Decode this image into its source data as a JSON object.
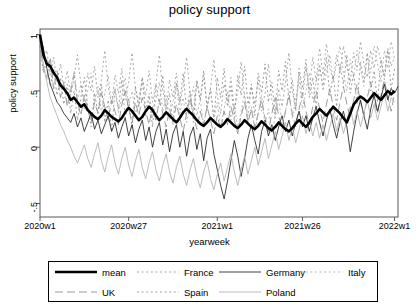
{
  "chart": {
    "title": "policy support",
    "xlabel": "yearweek",
    "ylabel": "policy support"
  },
  "axes": {
    "y_ticks": [
      "1",
      ".5",
      "0",
      "-.5"
    ],
    "x_ticks": [
      "2020w1",
      "2020w27",
      "2021w1",
      "2021w26",
      "2022w1"
    ]
  },
  "legend": {
    "row1": [
      {
        "label": "mean",
        "style": "solid-thick",
        "color": "#000000"
      },
      {
        "label": "France",
        "style": "dotted",
        "color": "#999999"
      },
      {
        "label": "Germany",
        "style": "solid",
        "color": "#222222"
      },
      {
        "label": "Italy",
        "style": "dotted",
        "color": "#aaaaaa"
      }
    ],
    "row2": [
      {
        "label": "UK",
        "style": "dashed-long",
        "color": "#8a8a8a"
      },
      {
        "label": "Spain",
        "style": "dotted",
        "color": "#8a8a8a"
      },
      {
        "label": "Poland",
        "style": "solid",
        "color": "#b0b0b0"
      }
    ]
  },
  "chart_data": {
    "type": "line",
    "title": "policy support",
    "xlabel": "yearweek",
    "ylabel": "policy support",
    "xlim": [
      0,
      105
    ],
    "ylim": [
      -0.62,
      1.05
    ],
    "grid": false,
    "legend_position": "bottom-outside",
    "x_tick_values": [
      0,
      26,
      52,
      77,
      104
    ],
    "x_tick_labels": [
      "2020w1",
      "2020w27",
      "2021w1",
      "2021w26",
      "2022w1"
    ],
    "y_tick_values": [
      1,
      0.5,
      0,
      -0.5
    ],
    "y_tick_labels": [
      "1",
      ".5",
      "0",
      "-.5"
    ],
    "series": [
      {
        "name": "mean",
        "style": "solid-thick",
        "color": "#000000",
        "values": [
          1.0,
          0.82,
          0.74,
          0.72,
          0.66,
          0.62,
          0.55,
          0.52,
          0.48,
          0.42,
          0.44,
          0.4,
          0.36,
          0.38,
          0.33,
          0.3,
          0.27,
          0.25,
          0.28,
          0.33,
          0.3,
          0.27,
          0.25,
          0.23,
          0.26,
          0.31,
          0.35,
          0.32,
          0.28,
          0.24,
          0.27,
          0.32,
          0.36,
          0.33,
          0.28,
          0.24,
          0.27,
          0.31,
          0.28,
          0.25,
          0.22,
          0.26,
          0.31,
          0.34,
          0.31,
          0.28,
          0.24,
          0.21,
          0.19,
          0.22,
          0.26,
          0.23,
          0.2,
          0.18,
          0.21,
          0.25,
          0.22,
          0.19,
          0.17,
          0.2,
          0.24,
          0.21,
          0.18,
          0.16,
          0.19,
          0.23,
          0.2,
          0.17,
          0.15,
          0.18,
          0.22,
          0.19,
          0.16,
          0.14,
          0.17,
          0.21,
          0.24,
          0.21,
          0.18,
          0.22,
          0.27,
          0.3,
          0.34,
          0.31,
          0.28,
          0.32,
          0.36,
          0.33,
          0.3,
          0.26,
          0.22,
          0.3,
          0.38,
          0.42,
          0.45,
          0.43,
          0.4,
          0.44,
          0.48,
          0.45,
          0.42,
          0.46,
          0.5,
          0.47,
          0.5
        ]
      },
      {
        "name": "UK",
        "style": "dashed-long",
        "color": "#8a8a8a",
        "values": [
          0.95,
          0.7,
          0.62,
          0.8,
          0.52,
          0.68,
          0.44,
          0.58,
          0.36,
          0.5,
          0.64,
          0.4,
          0.28,
          0.46,
          0.34,
          0.22,
          0.4,
          0.3,
          0.48,
          0.36,
          0.24,
          0.42,
          0.32,
          0.2,
          0.38,
          0.5,
          0.34,
          0.22,
          0.4,
          0.28,
          0.44,
          0.32,
          0.2,
          0.36,
          0.24,
          0.42,
          0.3,
          0.18,
          0.34,
          0.22,
          0.38,
          0.26,
          0.14,
          0.3,
          0.44,
          0.28,
          0.16,
          0.32,
          0.2,
          0.36,
          0.24,
          0.12,
          0.28,
          0.16,
          0.32,
          0.2,
          0.36,
          0.24,
          0.12,
          0.28,
          0.4,
          0.22,
          0.34,
          0.18,
          0.3,
          0.42,
          0.26,
          0.14,
          0.3,
          0.44,
          0.28,
          0.16,
          0.32,
          0.46,
          0.3,
          0.18,
          0.34,
          0.48,
          0.32,
          0.2,
          0.36,
          0.5,
          0.34,
          0.22,
          0.38,
          0.52,
          0.36,
          0.24,
          0.4,
          0.54,
          0.38,
          0.26,
          0.42,
          0.56,
          0.4,
          0.28,
          0.44,
          0.58,
          0.42,
          0.3,
          0.46,
          0.6,
          0.44,
          0.32,
          0.48
        ]
      },
      {
        "name": "France",
        "style": "dotted",
        "color": "#999999",
        "values": [
          0.92,
          0.78,
          0.86,
          0.64,
          0.8,
          0.58,
          0.74,
          0.52,
          0.68,
          0.46,
          0.62,
          0.82,
          0.56,
          0.4,
          0.66,
          0.5,
          0.72,
          0.44,
          0.6,
          0.86,
          0.54,
          0.38,
          0.64,
          0.48,
          0.7,
          0.42,
          0.58,
          0.84,
          0.52,
          0.36,
          0.62,
          0.46,
          0.68,
          0.4,
          0.56,
          0.82,
          0.5,
          0.34,
          0.6,
          0.44,
          0.66,
          0.38,
          0.54,
          0.8,
          0.48,
          0.32,
          0.58,
          0.42,
          0.64,
          0.36,
          0.52,
          0.78,
          0.46,
          0.3,
          0.56,
          0.4,
          0.62,
          0.34,
          0.5,
          0.76,
          0.44,
          0.28,
          0.54,
          0.38,
          0.6,
          0.32,
          0.48,
          0.74,
          0.42,
          0.26,
          0.52,
          0.36,
          0.58,
          0.84,
          0.5,
          0.34,
          0.66,
          0.44,
          0.72,
          0.5,
          0.8,
          0.58,
          0.88,
          0.64,
          0.92,
          0.7,
          0.6,
          0.82,
          0.66,
          0.9,
          0.72,
          0.58,
          0.84,
          0.68,
          0.94,
          0.74,
          0.62,
          0.86,
          0.7,
          0.9,
          0.76,
          0.64,
          0.88,
          0.72,
          0.8
        ]
      },
      {
        "name": "Spain",
        "style": "dotted",
        "color": "#8a8a8a",
        "values": [
          0.9,
          0.66,
          0.78,
          0.54,
          0.7,
          0.46,
          0.62,
          0.38,
          0.56,
          0.3,
          0.5,
          0.24,
          0.44,
          0.62,
          0.36,
          0.18,
          0.48,
          0.3,
          0.56,
          0.22,
          0.42,
          0.14,
          0.52,
          0.34,
          0.6,
          0.26,
          0.44,
          0.16,
          0.54,
          0.36,
          0.62,
          0.28,
          0.46,
          0.18,
          0.56,
          0.38,
          0.64,
          0.3,
          0.48,
          0.2,
          0.58,
          0.4,
          0.66,
          0.32,
          0.5,
          0.22,
          0.6,
          0.42,
          0.68,
          0.34,
          0.52,
          0.24,
          0.62,
          0.44,
          0.7,
          0.36,
          0.54,
          0.26,
          0.64,
          0.46,
          0.72,
          0.38,
          0.56,
          0.28,
          0.66,
          0.48,
          0.74,
          0.4,
          0.58,
          0.3,
          0.68,
          0.5,
          0.76,
          0.42,
          0.6,
          0.32,
          0.7,
          0.52,
          0.78,
          0.44,
          0.62,
          0.34,
          0.72,
          0.54,
          0.8,
          0.46,
          0.64,
          0.36,
          0.74,
          0.56,
          0.82,
          0.48,
          0.66,
          0.38,
          0.76,
          0.58,
          0.84,
          0.5,
          0.68,
          0.4,
          0.78,
          0.6,
          0.86,
          0.52,
          0.7
        ]
      },
      {
        "name": "Germany",
        "style": "solid",
        "color": "#222222",
        "values": [
          1.0,
          0.88,
          0.7,
          0.56,
          0.48,
          0.4,
          0.36,
          0.3,
          0.26,
          0.22,
          0.3,
          0.18,
          0.26,
          0.14,
          0.22,
          0.3,
          0.16,
          0.24,
          0.12,
          0.2,
          0.28,
          0.14,
          0.22,
          0.08,
          0.18,
          0.26,
          0.1,
          0.2,
          0.04,
          0.16,
          0.24,
          0.06,
          0.18,
          0.0,
          0.14,
          0.22,
          0.02,
          0.16,
          -0.04,
          0.12,
          0.2,
          0.0,
          0.14,
          -0.08,
          0.1,
          0.18,
          -0.02,
          0.12,
          -0.12,
          0.08,
          0.16,
          -0.06,
          -0.2,
          -0.34,
          -0.46,
          -0.3,
          -0.12,
          0.06,
          -0.08,
          -0.26,
          -0.1,
          0.08,
          0.2,
          0.06,
          -0.06,
          0.14,
          0.24,
          0.1,
          0.2,
          0.06,
          0.18,
          0.28,
          0.14,
          0.24,
          0.1,
          0.22,
          0.32,
          0.18,
          0.28,
          0.14,
          0.26,
          0.36,
          0.22,
          0.1,
          0.24,
          0.34,
          0.2,
          0.08,
          0.22,
          0.32,
          0.18,
          -0.04,
          0.14,
          0.3,
          0.42,
          0.28,
          0.16,
          0.34,
          0.46,
          0.32,
          0.44,
          0.56,
          0.42,
          0.52,
          0.48,
          0.54
        ]
      },
      {
        "name": "Italy",
        "style": "dotted",
        "color": "#aaaaaa",
        "values": [
          0.88,
          0.74,
          0.6,
          0.72,
          0.52,
          0.64,
          0.44,
          0.58,
          0.38,
          0.52,
          0.68,
          0.42,
          0.56,
          0.34,
          0.5,
          0.66,
          0.4,
          0.54,
          0.32,
          0.48,
          0.64,
          0.38,
          0.52,
          0.3,
          0.46,
          0.62,
          0.36,
          0.5,
          0.28,
          0.44,
          0.6,
          0.34,
          0.48,
          0.26,
          0.42,
          0.58,
          0.32,
          0.46,
          0.24,
          0.4,
          0.56,
          0.3,
          0.44,
          0.22,
          0.38,
          0.54,
          0.28,
          0.42,
          0.2,
          0.36,
          0.52,
          0.26,
          0.4,
          0.18,
          0.34,
          0.5,
          0.24,
          0.38,
          0.16,
          0.32,
          0.48,
          0.22,
          0.36,
          0.14,
          0.3,
          0.46,
          0.2,
          0.34,
          0.12,
          0.28,
          0.44,
          0.18,
          0.32,
          0.5,
          0.26,
          0.42,
          0.58,
          0.34,
          0.5,
          0.66,
          0.42,
          0.58,
          0.74,
          0.5,
          0.66,
          0.82,
          0.58,
          0.74,
          0.9,
          0.66,
          0.5,
          0.78,
          0.62,
          0.86,
          0.7,
          0.54,
          0.82,
          0.66,
          0.9,
          0.74,
          0.58,
          0.86,
          0.7,
          0.94,
          0.78
        ]
      },
      {
        "name": "Poland",
        "style": "solid",
        "color": "#b0b0b0",
        "values": [
          0.96,
          0.72,
          0.58,
          0.44,
          0.36,
          0.28,
          0.2,
          0.14,
          0.06,
          0.0,
          -0.08,
          -0.14,
          -0.06,
          0.02,
          -0.1,
          -0.18,
          -0.06,
          0.04,
          -0.12,
          -0.22,
          -0.08,
          0.02,
          -0.14,
          -0.24,
          -0.1,
          0.0,
          -0.16,
          -0.26,
          -0.12,
          -0.02,
          -0.18,
          -0.28,
          -0.14,
          -0.04,
          -0.2,
          -0.3,
          -0.16,
          -0.06,
          -0.22,
          -0.32,
          -0.18,
          -0.08,
          -0.24,
          -0.34,
          -0.2,
          -0.1,
          -0.26,
          -0.36,
          -0.22,
          -0.12,
          -0.28,
          -0.38,
          -0.24,
          -0.14,
          -0.3,
          -0.18,
          -0.06,
          -0.22,
          -0.34,
          -0.2,
          -0.08,
          -0.24,
          -0.12,
          0.0,
          -0.16,
          -0.04,
          0.08,
          -0.1,
          0.02,
          0.14,
          -0.02,
          0.1,
          0.22,
          0.06,
          0.18,
          0.04,
          0.16,
          0.28,
          0.12,
          0.24,
          0.1,
          0.22,
          0.08,
          0.2,
          0.06,
          0.18,
          0.3,
          0.14,
          0.26,
          0.12,
          0.24,
          0.36,
          0.2,
          0.32,
          0.18,
          0.3,
          0.42,
          0.26,
          0.38,
          0.24,
          0.36,
          0.48,
          0.32,
          0.44,
          0.4
        ]
      }
    ]
  }
}
